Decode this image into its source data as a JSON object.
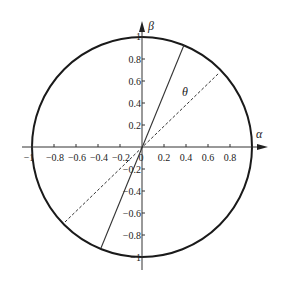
{
  "diagram": {
    "type": "unit-circle-rotation",
    "axes": {
      "horizontal_label": "α",
      "vertical_label": "β"
    },
    "x_ticks": [
      "−1",
      "−0.8",
      "−0.6",
      "−0.4",
      "−0.2",
      "0",
      "0.2",
      "0.4",
      "0.6",
      "0.8"
    ],
    "y_ticks": [
      "1",
      "0.8",
      "0.6",
      "0.4",
      "0.2",
      "−0.2",
      "−0.4",
      "−0.6",
      "−0.8",
      "−1"
    ],
    "angle_label": "θ",
    "lines": [
      {
        "name": "solid-vector",
        "style": "solid"
      },
      {
        "name": "dashed-vector",
        "style": "dashed"
      }
    ],
    "colors": {
      "stroke": "#1a1a1a",
      "background": "#ffffff"
    }
  }
}
